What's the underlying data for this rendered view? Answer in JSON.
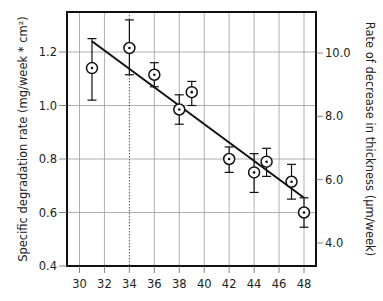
{
  "chart_data": {
    "type": "scatter",
    "title": "",
    "xlabel": "",
    "ylabel": "Specific degradation rate (mg/week * cm²)",
    "ylabel_right": "Rate of decrease in thickness (µm/week)",
    "xlim": [
      29,
      49
    ],
    "ylim": [
      0.4,
      1.35
    ],
    "ylim_right": [
      3.4,
      11.4
    ],
    "x_ticks": [
      30,
      32,
      34,
      36,
      38,
      40,
      42,
      44,
      46,
      48
    ],
    "x_tick_labels": [
      "30",
      "32",
      "34",
      "36",
      "38",
      "40",
      "42",
      "44",
      "46",
      "48"
    ],
    "y_ticks": [
      0.4,
      0.6,
      0.8,
      1.0,
      1.2
    ],
    "y_tick_labels": [
      "0.4",
      "0.6",
      "0.8",
      "1.0",
      "1.2"
    ],
    "y_right_ticks": [
      4.0,
      6.0,
      8.0,
      10.0
    ],
    "y_right_tick_labels": [
      "4.0",
      "6.0",
      "8.0",
      "10.0"
    ],
    "grid": true,
    "legend": null,
    "series": [
      {
        "name": "measurements",
        "marker": "circle-dot",
        "points": [
          {
            "x": 31,
            "y": 1.14,
            "err_low": 1.02,
            "err_high": 1.25
          },
          {
            "x": 34,
            "y": 1.215,
            "err_low": 1.115,
            "err_high": 1.32
          },
          {
            "x": 36,
            "y": 1.115,
            "err_low": 1.07,
            "err_high": 1.16
          },
          {
            "x": 38,
            "y": 0.985,
            "err_low": 0.93,
            "err_high": 1.04
          },
          {
            "x": 39,
            "y": 1.05,
            "err_low": 1.0,
            "err_high": 1.09
          },
          {
            "x": 42,
            "y": 0.8,
            "err_low": 0.75,
            "err_high": 0.845
          },
          {
            "x": 44,
            "y": 0.75,
            "err_low": 0.675,
            "err_high": 0.82
          },
          {
            "x": 45,
            "y": 0.79,
            "err_low": 0.735,
            "err_high": 0.84
          },
          {
            "x": 47,
            "y": 0.715,
            "err_low": 0.65,
            "err_high": 0.78
          },
          {
            "x": 48,
            "y": 0.6,
            "err_low": 0.545,
            "err_high": 0.655
          }
        ]
      },
      {
        "name": "linear fit",
        "type": "line",
        "points": [
          {
            "x": 31,
            "y": 1.24
          },
          {
            "x": 48,
            "y": 0.655
          }
        ]
      }
    ],
    "annotations": [
      {
        "type": "dotted-vertical-line",
        "x": 34
      }
    ]
  }
}
